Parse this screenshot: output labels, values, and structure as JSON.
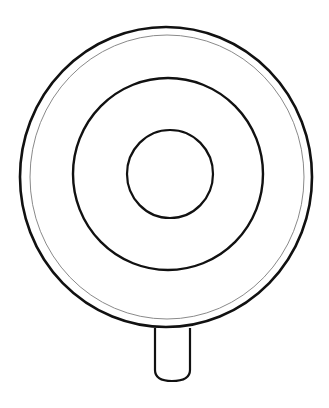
{
  "image": {
    "subject": "lollipop coloring page",
    "background": "#ffffff",
    "line_color": "#111111",
    "inner_rim_color": "#8a8a8a"
  },
  "shapes": {
    "outer_circle": {
      "cx": 166,
      "cy": 177,
      "rx": 146,
      "ry": 150
    },
    "rim_circle": {
      "cx": 167,
      "cy": 177,
      "rx": 137,
      "ry": 142
    },
    "middle_circle": {
      "cx": 168,
      "cy": 174,
      "rx": 95,
      "ry": 96
    },
    "inner_circle": {
      "cx": 170,
      "cy": 174,
      "rx": 43,
      "ry": 44
    },
    "stick": {
      "x": 155,
      "y": 327,
      "width": 35,
      "height": 54
    }
  }
}
